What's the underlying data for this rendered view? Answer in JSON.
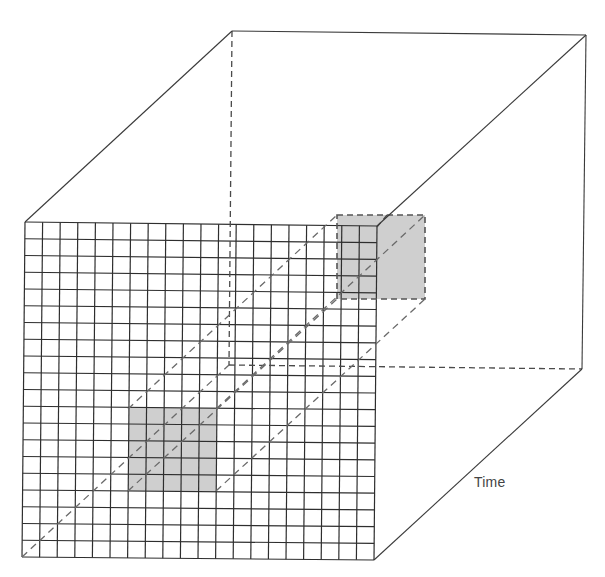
{
  "diagram": {
    "title": "",
    "axis_label_time": "Time",
    "colors": {
      "line": "#3a3a3a",
      "dashed": "#555555",
      "shade": "#cfcfcf",
      "background": "#ffffff"
    },
    "grid": {
      "columns": 20,
      "rows": 20
    },
    "front_face": {
      "tl": [
        25,
        222
      ],
      "tr": [
        377,
        226
      ],
      "br": [
        374,
        560
      ],
      "bl": [
        22,
        557
      ]
    },
    "back_face": {
      "tl": [
        232,
        31
      ],
      "tr": [
        586,
        35
      ],
      "br": [
        582,
        369
      ],
      "bl": [
        229,
        365
      ]
    },
    "highlight_front": {
      "col_start": 6,
      "col_end": 11,
      "row_start": 11,
      "row_end": 16,
      "rect": [
        128,
        409,
        216,
        491
      ]
    },
    "highlight_back": {
      "rect": [
        337,
        215,
        425,
        299
      ]
    },
    "time_label_position": [
      474,
      474
    ]
  }
}
